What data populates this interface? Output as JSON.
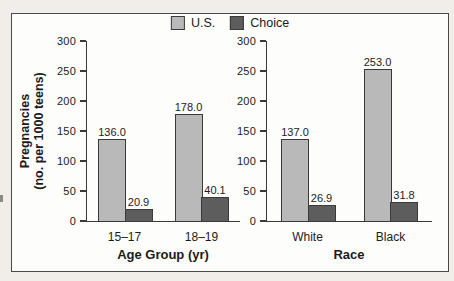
{
  "figure": {
    "page_background": "#f1eee9",
    "frame_background": "#fdfdfb",
    "frame_border": "#4a4a4a"
  },
  "colors": {
    "us": "#b9b9b9",
    "choice": "#5d5d5d",
    "bar_border": "#3a3a3a",
    "axis": "#3a3a3a",
    "text": "#1b1b1b"
  },
  "y_axis": {
    "label_line1": "Pregnancies",
    "label_line2": "(no. per 1000 teens)"
  },
  "chart_data": [
    {
      "type": "bar",
      "categories": [
        "15–17",
        "18–19"
      ],
      "series": [
        {
          "name": "U.S.",
          "values": [
            136.0,
            178.0
          ]
        },
        {
          "name": "Choice",
          "values": [
            20.9,
            40.1
          ]
        }
      ],
      "xlabel": "Age Group (yr)",
      "ylabel": "Pregnancies (no. per 1000 teens)",
      "ylim": [
        0,
        300
      ],
      "yticks": [
        0,
        50,
        100,
        150,
        200,
        250,
        300
      ],
      "grid": false,
      "legend_position": "top-center",
      "value_labels": [
        "136.0",
        "20.9",
        "178.0",
        "40.1"
      ]
    },
    {
      "type": "bar",
      "categories": [
        "White",
        "Black"
      ],
      "series": [
        {
          "name": "U.S.",
          "values": [
            137.0,
            253.0
          ]
        },
        {
          "name": "Choice",
          "values": [
            26.9,
            31.8
          ]
        }
      ],
      "xlabel": "Race",
      "ylabel": "Pregnancies (no. per 1000 teens)",
      "ylim": [
        0,
        300
      ],
      "yticks": [
        0,
        50,
        100,
        150,
        200,
        250,
        300
      ],
      "grid": false,
      "legend_position": "top-center",
      "value_labels": [
        "137.0",
        "26.9",
        "253.0",
        "31.8"
      ]
    }
  ]
}
